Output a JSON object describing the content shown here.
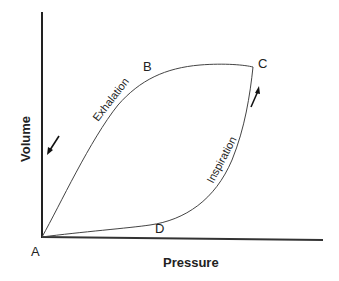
{
  "diagram": {
    "axes": {
      "x_label": "Pressure",
      "y_label": "Volume"
    },
    "points": {
      "A": "A",
      "B": "B",
      "C": "C",
      "D": "D"
    },
    "phases": {
      "exhalation": "Exhalation",
      "inspiration": "Inspiration"
    },
    "colors": {
      "line": "#333333",
      "axis": "#222222",
      "text": "#222222"
    }
  }
}
